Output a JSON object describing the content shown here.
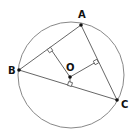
{
  "diagram": {
    "circle": {
      "cx": 71,
      "cy": 75,
      "r": 53,
      "stroke": "#888888"
    },
    "points": {
      "A": {
        "label": "A",
        "x": 81,
        "y": 25,
        "lx": 78,
        "ly": 18
      },
      "B": {
        "label": "B",
        "x": 19,
        "y": 70,
        "lx": 8,
        "ly": 74
      },
      "C": {
        "label": "C",
        "x": 117,
        "y": 100,
        "lx": 121,
        "ly": 108
      },
      "O": {
        "label": "O",
        "x": 70,
        "y": 77,
        "lx": 66,
        "ly": 71
      }
    },
    "foot_AB": {
      "x": 50,
      "y": 50
    },
    "foot_AC": {
      "x": 96,
      "y": 62
    },
    "foot_BC": {
      "x": 70,
      "y": 85
    },
    "line_color": "#555555"
  }
}
